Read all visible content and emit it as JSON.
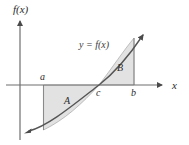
{
  "figure": {
    "axes": {
      "y_axis_label": "f(x)",
      "x_axis_label": "x"
    },
    "curve": {
      "label": "y = f(x)",
      "stroke_color": "#555555",
      "description": "increasing curve crossing the x-axis at c"
    },
    "points": [
      {
        "name": "a",
        "label": "a",
        "x": 43.5,
        "axis_position": "above-axis"
      },
      {
        "name": "c",
        "label": "c",
        "x": 99.0,
        "axis_position": "below-axis"
      },
      {
        "name": "b",
        "label": "b",
        "x": 134.0,
        "axis_position": "below-axis"
      }
    ],
    "regions": [
      {
        "name": "A",
        "label": "A",
        "position": "below-axis",
        "from": "a",
        "to": "c",
        "fill_color": "#e2e2e2"
      },
      {
        "name": "B",
        "label": "B",
        "position": "above-axis",
        "from": "c",
        "to": "b",
        "fill_color": "#e2e2e2"
      }
    ],
    "colors": {
      "axis": "#6e6e6e",
      "curve": "#555555",
      "region_fill": "#e2e2e2",
      "region_edge": "#9a9a9a",
      "text": "#2b2b2b",
      "background": "#ffffff"
    }
  }
}
